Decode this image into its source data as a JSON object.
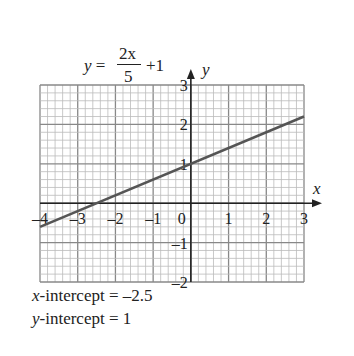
{
  "equation": {
    "lhs": "y =",
    "numerator": "2x",
    "denominator": "5",
    "rest": "+1"
  },
  "axis_labels": {
    "x": "x",
    "y": "y"
  },
  "notes": [
    {
      "var": "x",
      "text": "-intercept = –2.5"
    },
    {
      "var": "y",
      "text": "-intercept = 1"
    }
  ],
  "chart_data": {
    "type": "line",
    "xlabel": "x",
    "ylabel": "y",
    "xlim": [
      -4,
      3
    ],
    "ylim": [
      -2,
      3
    ],
    "grid": true,
    "minor_divisions_per_unit": 5,
    "x_ticks": [
      "-4",
      "-3",
      "-2",
      "-1",
      "0",
      "1",
      "2",
      "3"
    ],
    "y_ticks": [
      "-2",
      "-1",
      "1",
      "2",
      "3"
    ],
    "series": [
      {
        "name": "y = 2x/5 + 1",
        "x": [
          -4,
          3
        ],
        "y": [
          -0.6,
          2.2
        ],
        "color": "#555555"
      }
    ],
    "annotations": [
      "x-intercept = –2.5",
      "y-intercept = 1"
    ]
  }
}
